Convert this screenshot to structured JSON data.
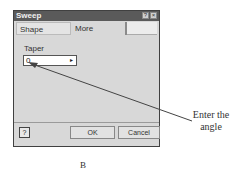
{
  "dialog": {
    "title": "Sweep",
    "title_buttons": {
      "help": "?",
      "close": "×"
    },
    "tabs": [
      {
        "label": "Shape",
        "active": false
      },
      {
        "label": "More",
        "active": true
      }
    ],
    "fields": {
      "taper": {
        "label": "Taper",
        "value": "0",
        "arrow": "▸"
      }
    },
    "footer": {
      "help_icon": "?",
      "ok_label": "OK",
      "cancel_label": "Cancel"
    }
  },
  "annotation": {
    "text_line1": "Enter the",
    "text_line2": "angle"
  },
  "caption": "B"
}
